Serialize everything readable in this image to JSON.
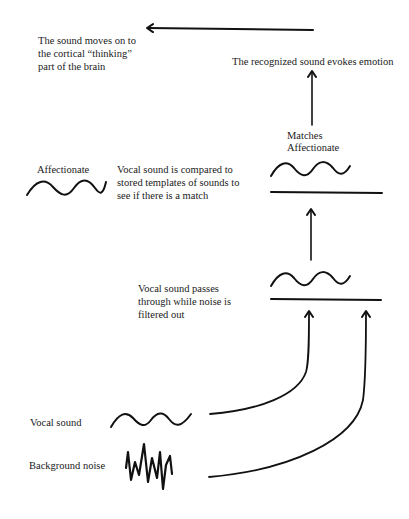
{
  "diagram": {
    "type": "flow",
    "stroke_color": "#111111",
    "background": "#ffffff",
    "labels": {
      "cortical": [
        "The sound moves on to",
        "the cortical “thinking”",
        "part of the brain"
      ],
      "emotion": "The recognized sound evokes emotion",
      "matches": [
        "Matches",
        "Affectionate"
      ],
      "template_name": "Affectionate",
      "compare": [
        "Vocal sound is compared to",
        "stored templates of sounds to",
        "see if there is a match"
      ],
      "filter": [
        "Vocal sound passes",
        "through while noise is",
        "filtered out"
      ],
      "vocal": "Vocal sound",
      "noise": "Background noise"
    },
    "nodes": [
      {
        "id": "vocal-input",
        "label": "Vocal sound",
        "icon": "sine-wave"
      },
      {
        "id": "noise-input",
        "label": "Background noise",
        "icon": "noise-wave"
      },
      {
        "id": "filter",
        "label": "Vocal sound passes through while noise is filtered out",
        "icon": "filter-bar"
      },
      {
        "id": "template",
        "label": "Affectionate",
        "icon": "sine-wave"
      },
      {
        "id": "match",
        "label": "Matches Affectionate",
        "icon": "filter-bar"
      },
      {
        "id": "emotion",
        "label": "The recognized sound evokes emotion"
      },
      {
        "id": "cortex",
        "label": "The sound moves on to the cortical “thinking” part of the brain"
      }
    ],
    "edges": [
      {
        "from": "vocal-input",
        "to": "filter"
      },
      {
        "from": "noise-input",
        "to": "filter"
      },
      {
        "from": "filter",
        "to": "match"
      },
      {
        "from": "match",
        "to": "emotion"
      },
      {
        "from": "emotion",
        "to": "cortex"
      }
    ]
  }
}
